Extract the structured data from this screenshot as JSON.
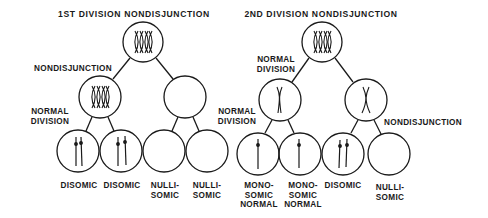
{
  "diagram": {
    "colors": {
      "ink": "#1a1a1a",
      "background": "#ffffff"
    },
    "panels": [
      {
        "title": "1ST DIVISION NONDISJUNCTION",
        "top_cell": {
          "chromosomes": "two replicated homolog pairs (X-shaped)"
        },
        "branch_labels": {
          "first": "NONDISJUNCTION",
          "second": "NORMAL\nDIVISION"
        },
        "middle_cells": [
          {
            "chromosomes": "two replicated homologs"
          },
          {
            "chromosomes": "empty"
          }
        ],
        "gametes": [
          {
            "label": "DISOMIC",
            "chromosomes": 2
          },
          {
            "label": "DISOMIC",
            "chromosomes": 2
          },
          {
            "label": "NULLI-\nSOMIC",
            "chromosomes": 0
          },
          {
            "label": "NULLI-\nSOMIC",
            "chromosomes": 0
          }
        ]
      },
      {
        "title": "2ND DIVISION NONDISJUNCTION",
        "top_cell": {
          "chromosomes": "two replicated homolog pairs (X-shaped)"
        },
        "branch_labels": {
          "first": "NORMAL\nDIVISION",
          "second_left": "NORMAL\nDIVISION",
          "second_right": "NONDISJUNCTION"
        },
        "middle_cells": [
          {
            "chromosomes": "one replicated chromosome"
          },
          {
            "chromosomes": "one replicated chromosome"
          }
        ],
        "gametes": [
          {
            "label": "MONO-\nSOMIC\nNORMAL",
            "chromosomes": 1
          },
          {
            "label": "MONO-\nSOMIC\nNORMAL",
            "chromosomes": 1
          },
          {
            "label": "DISOMIC",
            "chromosomes": 2
          },
          {
            "label": "NULLI-\nSOMIC",
            "chromosomes": 0
          }
        ]
      }
    ]
  }
}
